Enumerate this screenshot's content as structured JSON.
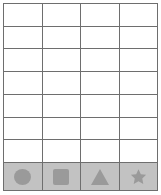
{
  "grid": {
    "columns": 4,
    "empty_rows": 7,
    "total_rows": 8,
    "border_color": "#6e6e6e",
    "cell_background": "#ffffff",
    "shape_row_background": "#c2c2c2",
    "shape_color": "#9a9a9a"
  },
  "shape_row": {
    "cells": [
      {
        "icon": "circle-icon",
        "label": ""
      },
      {
        "icon": "square-icon",
        "label": ""
      },
      {
        "icon": "triangle-icon",
        "label": ""
      },
      {
        "icon": "star-icon",
        "label": ""
      }
    ]
  },
  "empty_cells": {
    "value": ""
  }
}
